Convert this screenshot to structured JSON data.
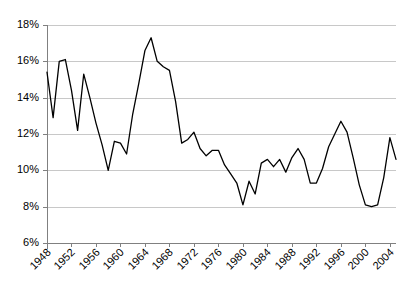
{
  "chart_data": {
    "type": "line",
    "title": "",
    "subtitle": "",
    "xlabel": "",
    "ylabel": "",
    "grid": "horizontal",
    "legend": "none",
    "ylim": [
      6,
      18
    ],
    "ytick_labels": [
      "6%",
      "8%",
      "10%",
      "12%",
      "14%",
      "16%",
      "18%"
    ],
    "ytick_values": [
      6,
      8,
      10,
      12,
      14,
      16,
      18
    ],
    "xlim": [
      1948,
      2005
    ],
    "xtick_labels": [
      "1948",
      "1952",
      "1956",
      "1960",
      "1964",
      "1968",
      "1972",
      "1976",
      "1980",
      "1984",
      "1988",
      "1992",
      "1996",
      "2000",
      "2004"
    ],
    "xtick_values": [
      1948,
      1952,
      1956,
      1960,
      1964,
      1968,
      1972,
      1976,
      1980,
      1984,
      1988,
      1992,
      1996,
      2000,
      2004
    ],
    "series": [
      {
        "name": "series-1",
        "color": "#000000",
        "x": [
          1948,
          1949,
          1950,
          1951,
          1952,
          1953,
          1954,
          1955,
          1956,
          1957,
          1958,
          1959,
          1960,
          1961,
          1962,
          1963,
          1964,
          1965,
          1966,
          1967,
          1968,
          1969,
          1970,
          1971,
          1972,
          1973,
          1974,
          1975,
          1976,
          1977,
          1978,
          1979,
          1980,
          1981,
          1982,
          1983,
          1984,
          1985,
          1986,
          1987,
          1988,
          1989,
          1990,
          1991,
          1992,
          1993,
          1994,
          1995,
          1996,
          1997,
          1998,
          1999,
          2000,
          2001,
          2002,
          2003,
          2004,
          2005
        ],
        "values": [
          15.4,
          12.9,
          16.0,
          16.1,
          14.4,
          12.2,
          15.3,
          14.0,
          12.6,
          11.4,
          10.0,
          11.6,
          11.5,
          10.9,
          13.1,
          14.8,
          16.6,
          17.3,
          16.0,
          15.7,
          15.5,
          13.8,
          11.5,
          11.7,
          12.1,
          11.2,
          10.8,
          11.1,
          11.1,
          10.3,
          9.8,
          9.3,
          8.1,
          9.4,
          8.7,
          10.4,
          10.6,
          10.2,
          10.6,
          9.9,
          10.7,
          11.2,
          10.6,
          9.3,
          9.3,
          10.1,
          11.3,
          12.0,
          12.7,
          12.1,
          10.7,
          9.2,
          8.1,
          8.0,
          8.1,
          9.6,
          11.8,
          10.6
        ]
      }
    ]
  }
}
